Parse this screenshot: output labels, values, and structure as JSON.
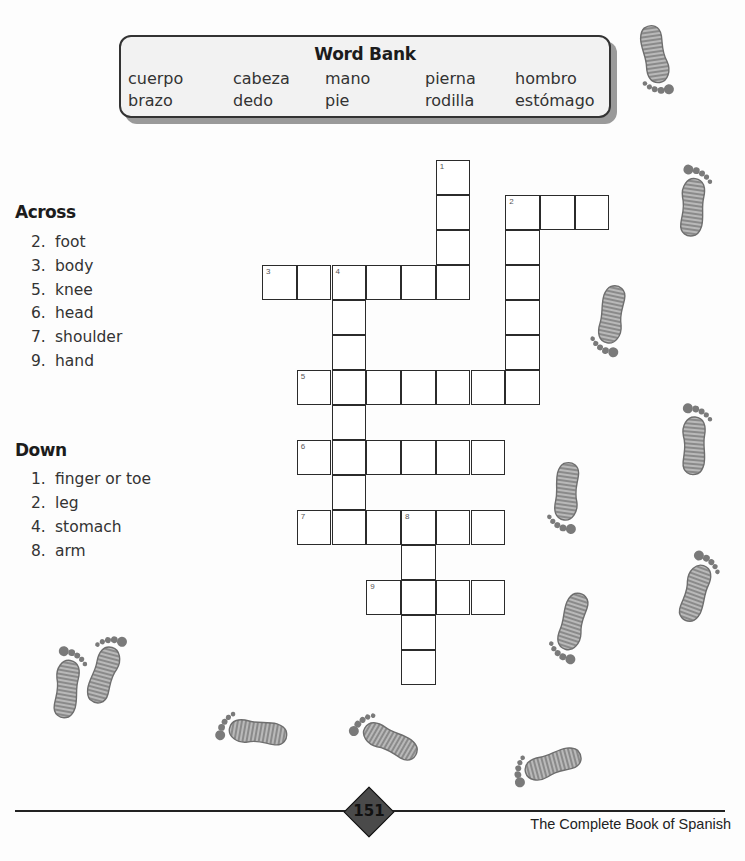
{
  "word_bank": {
    "title": "Word Bank",
    "rows": [
      [
        "cuerpo",
        "cabeza",
        "mano",
        "pierna",
        "hombro"
      ],
      [
        "brazo",
        "dedo",
        "pie",
        "rodilla",
        "estómago"
      ]
    ]
  },
  "clues": {
    "across": {
      "heading": "Across",
      "items": [
        {
          "num": "2.",
          "text": "foot"
        },
        {
          "num": "3.",
          "text": "body"
        },
        {
          "num": "5.",
          "text": "knee"
        },
        {
          "num": "6.",
          "text": "head"
        },
        {
          "num": "7.",
          "text": "shoulder"
        },
        {
          "num": "9.",
          "text": "hand"
        }
      ]
    },
    "down": {
      "heading": "Down",
      "items": [
        {
          "num": "1.",
          "text": "finger or toe"
        },
        {
          "num": "2.",
          "text": "leg"
        },
        {
          "num": "4.",
          "text": "stomach"
        },
        {
          "num": "8.",
          "text": "arm"
        }
      ]
    }
  },
  "crossword": {
    "entries": [
      {
        "number": "1",
        "direction": "down",
        "row": 0,
        "col": 5,
        "length": 4
      },
      {
        "number": "2",
        "direction": "across",
        "row": 1,
        "col": 7,
        "length": 3
      },
      {
        "number": "2",
        "direction": "down",
        "row": 1,
        "col": 7,
        "length": 6
      },
      {
        "number": "3",
        "direction": "across",
        "row": 3,
        "col": 0,
        "length": 6
      },
      {
        "number": "4",
        "direction": "down",
        "row": 3,
        "col": 2,
        "length": 8
      },
      {
        "number": "5",
        "direction": "across",
        "row": 6,
        "col": 1,
        "length": 7
      },
      {
        "number": "6",
        "direction": "across",
        "row": 8,
        "col": 1,
        "length": 6
      },
      {
        "number": "7",
        "direction": "across",
        "row": 10,
        "col": 1,
        "length": 6
      },
      {
        "number": "8",
        "direction": "down",
        "row": 10,
        "col": 4,
        "length": 5
      },
      {
        "number": "9",
        "direction": "across",
        "row": 12,
        "col": 3,
        "length": 4
      }
    ]
  },
  "footer": {
    "page_number": "151",
    "book_title": "The Complete Book of Spanish"
  }
}
